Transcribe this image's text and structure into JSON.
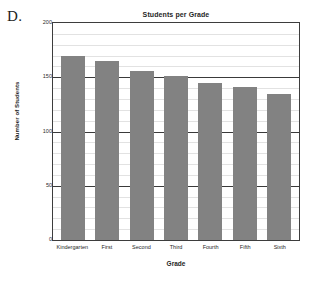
{
  "panel": {
    "letter": "D."
  },
  "chart_data": {
    "type": "bar",
    "title": "Students per Grade",
    "xlabel": "Grade",
    "ylabel": "Number of Students",
    "categories": [
      "Kindergarten",
      "First",
      "Second",
      "Third",
      "Fourth",
      "Fifth",
      "Sixth"
    ],
    "values": [
      170,
      165,
      156,
      151,
      145,
      141,
      135
    ],
    "ylim": [
      0,
      200
    ],
    "ytick_labels": [
      "200",
      "150",
      "100",
      "50",
      "0"
    ],
    "ytick_values": [
      200,
      150,
      100,
      50,
      0
    ],
    "minor_tick_step": 10,
    "grid": true,
    "legend": "none",
    "bar_color": "#828282",
    "major_gridline_color": "#3a3a3a",
    "minor_gridline_color": "#e2e2e2",
    "frame_color": "#3d3d3d"
  }
}
